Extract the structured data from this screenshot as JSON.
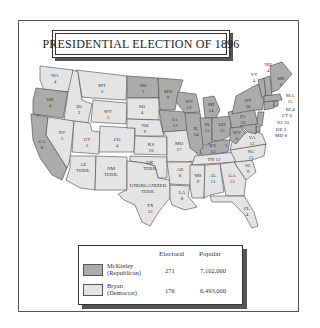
{
  "title": "PRESIDENTIAL ELECTION OF 1896",
  "colors": {
    "republican": "#ababab",
    "democrat": "#e4e4e4",
    "border": "#444444"
  },
  "legend": {
    "headers": {
      "electoral": "Electoral",
      "popular": "Popular"
    },
    "rows": [
      {
        "candidate": "McKinley",
        "party": "(Republican)",
        "electoral": "271",
        "popular": "7,102,000",
        "color": "#ababab"
      },
      {
        "candidate": "Bryan",
        "party": "(Democrat)",
        "electoral": "176",
        "popular": "6,493,000",
        "color": "#e4e4e4"
      }
    ]
  },
  "states": [
    {
      "abbr": "WA",
      "ev": "4",
      "winner": "D"
    },
    {
      "abbr": "OR",
      "ev": "4",
      "winner": "R"
    },
    {
      "abbr": "CA",
      "ev": "8",
      "winner": "R",
      "split_note": "1"
    },
    {
      "abbr": "ID",
      "ev": "3",
      "winner": "D"
    },
    {
      "abbr": "NV",
      "ev": "3",
      "winner": "D"
    },
    {
      "abbr": "MT",
      "ev": "3",
      "winner": "D"
    },
    {
      "abbr": "WY",
      "ev": "3",
      "winner": "D"
    },
    {
      "abbr": "UT",
      "ev": "3",
      "winner": "D"
    },
    {
      "abbr": "CO",
      "ev": "4",
      "winner": "D"
    },
    {
      "abbr": "AZ",
      "ev": "TERR.",
      "winner": "none"
    },
    {
      "abbr": "NM",
      "ev": "TERR.",
      "winner": "none"
    },
    {
      "abbr": "ND",
      "ev": "3",
      "winner": "R"
    },
    {
      "abbr": "SD",
      "ev": "4",
      "winner": "D"
    },
    {
      "abbr": "NB",
      "ev": "8",
      "winner": "D"
    },
    {
      "abbr": "KS",
      "ev": "10",
      "winner": "D"
    },
    {
      "abbr": "OK",
      "ev": "TERR.",
      "winner": "none"
    },
    {
      "abbr": "UNORGANIZED",
      "ev": "TERR.",
      "winner": "none"
    },
    {
      "abbr": "TX",
      "ev": "15",
      "winner": "D"
    },
    {
      "abbr": "MN",
      "ev": "9",
      "winner": "R"
    },
    {
      "abbr": "IA",
      "ev": "13",
      "winner": "R"
    },
    {
      "abbr": "MO",
      "ev": "17",
      "winner": "D"
    },
    {
      "abbr": "AR",
      "ev": "8",
      "winner": "D"
    },
    {
      "abbr": "LA",
      "ev": "8",
      "winner": "D"
    },
    {
      "abbr": "WS",
      "ev": "12",
      "winner": "R"
    },
    {
      "abbr": "IL",
      "ev": "24",
      "winner": "R"
    },
    {
      "abbr": "MI",
      "ev": "14",
      "winner": "R"
    },
    {
      "abbr": "IN",
      "ev": "15",
      "winner": "R"
    },
    {
      "abbr": "OH",
      "ev": "23",
      "winner": "R"
    },
    {
      "abbr": "KY",
      "ev": "12",
      "winner": "R",
      "split_note": "1"
    },
    {
      "abbr": "TN",
      "ev": "12",
      "winner": "D"
    },
    {
      "abbr": "MS",
      "ev": "9",
      "winner": "D"
    },
    {
      "abbr": "AL",
      "ev": "11",
      "winner": "D"
    },
    {
      "abbr": "GA",
      "ev": "13",
      "winner": "D"
    },
    {
      "abbr": "FL",
      "ev": "4",
      "winner": "D"
    },
    {
      "abbr": "SC",
      "ev": "9",
      "winner": "D"
    },
    {
      "abbr": "NC",
      "ev": "11",
      "winner": "D"
    },
    {
      "abbr": "VA",
      "ev": "12",
      "winner": "D"
    },
    {
      "abbr": "WV",
      "ev": "6",
      "winner": "R"
    },
    {
      "abbr": "PA",
      "ev": "32",
      "winner": "R"
    },
    {
      "abbr": "NY",
      "ev": "36",
      "winner": "R"
    },
    {
      "abbr": "VT",
      "ev": "4",
      "winner": "R"
    },
    {
      "abbr": "NH",
      "ev": "4",
      "winner": "R"
    },
    {
      "abbr": "ME",
      "ev": "6",
      "winner": "R"
    },
    {
      "abbr": "MA",
      "ev": "15",
      "winner": "R"
    },
    {
      "abbr": "RI",
      "ev": "4",
      "winner": "R"
    },
    {
      "abbr": "CT",
      "ev": "6",
      "winner": "R"
    },
    {
      "abbr": "NJ",
      "ev": "10",
      "winner": "R"
    },
    {
      "abbr": "DE",
      "ev": "3",
      "winner": "R"
    },
    {
      "abbr": "MD",
      "ev": "8",
      "winner": "R"
    }
  ]
}
